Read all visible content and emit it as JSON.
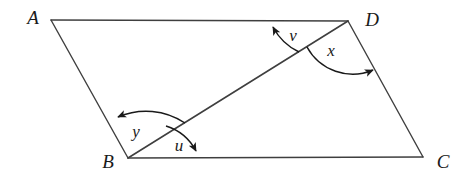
{
  "figure": {
    "shape": "parallelogram",
    "background_color": "#ffffff",
    "line_color": "#3f3f3f",
    "label_color": "#1a1a1a",
    "stroke_width": 1.4
  },
  "vertices": [
    {
      "name": "A",
      "label": "A",
      "x": 51,
      "y": 20,
      "label_x": 33,
      "label_y": 20
    },
    {
      "name": "D",
      "label": "D",
      "x": 348,
      "y": 21,
      "label_x": 372,
      "label_y": 22
    },
    {
      "name": "B",
      "label": "B",
      "x": 128,
      "y": 158,
      "label_x": 108,
      "label_y": 164
    },
    {
      "name": "C",
      "label": "C",
      "x": 423,
      "y": 157,
      "label_x": 443,
      "label_y": 164
    }
  ],
  "edges": [
    {
      "name": "AD",
      "from": "A",
      "to": "D"
    },
    {
      "name": "DC",
      "from": "D",
      "to": "C"
    },
    {
      "name": "BC",
      "from": "B",
      "to": "C"
    },
    {
      "name": "AB",
      "from": "A",
      "to": "B"
    }
  ],
  "diagonal": {
    "name": "BD",
    "from": "B",
    "to": "D"
  },
  "angles": [
    {
      "name": "v",
      "label": "v",
      "vertex": "D",
      "between": [
        "DB",
        "DA"
      ],
      "label_x": 293,
      "label_y": 37,
      "arrow_on": "DA"
    },
    {
      "name": "x",
      "label": "x",
      "vertex": "D",
      "between": [
        "DB",
        "DC"
      ],
      "label_x": 331,
      "label_y": 52,
      "arrow_on": "DC"
    },
    {
      "name": "y",
      "label": "y",
      "vertex": "B",
      "between": [
        "BD",
        "BA"
      ],
      "label_x": 136,
      "label_y": 133,
      "arrow_on": "BA"
    },
    {
      "name": "u",
      "label": "u",
      "vertex": "B",
      "between": [
        "BD",
        "BC"
      ],
      "label_x": 179,
      "label_y": 147,
      "arrow_on": "BC"
    }
  ]
}
